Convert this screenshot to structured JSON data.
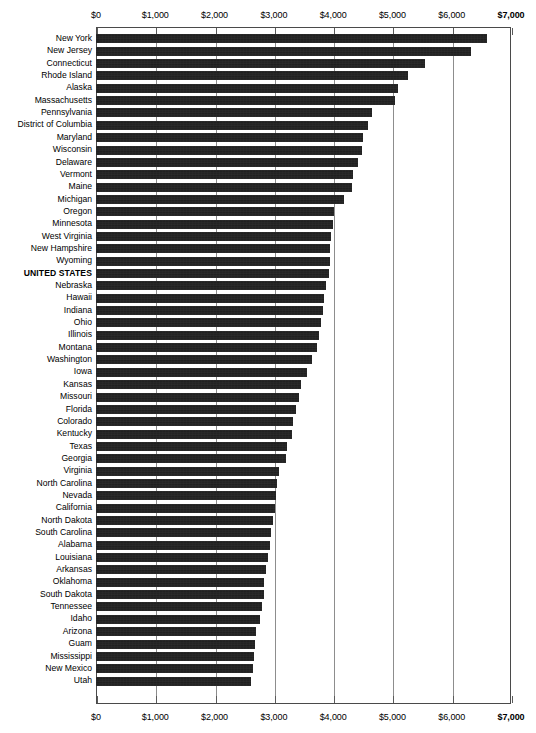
{
  "chart_data": {
    "type": "bar",
    "orientation": "horizontal",
    "title": "",
    "xlabel": "",
    "ylabel": "",
    "xlim": [
      0,
      7000
    ],
    "xticks": [
      0,
      1000,
      2000,
      3000,
      4000,
      5000,
      6000,
      7000
    ],
    "xtick_labels": [
      "$0",
      "$1,000",
      "$2,000",
      "$3,000",
      "$4,000",
      "$5,000",
      "$6,000",
      "$7,000"
    ],
    "grid": true,
    "grid_axis": "x",
    "legend": "none",
    "axis_position": "both-top-and-bottom",
    "bar_color": "#151515",
    "highlight_category": "UNITED STATES",
    "categories": [
      "New York",
      "New Jersey",
      "Connecticut",
      "Rhode Island",
      "Alaska",
      "Massachusetts",
      "Pennsylvania",
      "District of Columbia",
      "Maryland",
      "Wisconsin",
      "Delaware",
      "Vermont",
      "Maine",
      "Michigan",
      "Oregon",
      "Minnesota",
      "West Virginia",
      "New Hampshire",
      "Wyoming",
      "UNITED STATES",
      "Nebraska",
      "Hawaii",
      "Indiana",
      "Ohio",
      "Illinois",
      "Montana",
      "Washington",
      "Iowa",
      "Kansas",
      "Missouri",
      "Florida",
      "Colorado",
      "Kentucky",
      "Texas",
      "Georgia",
      "Virginia",
      "North Carolina",
      "Nevada",
      "California",
      "North Dakota",
      "South Carolina",
      "Alabama",
      "Louisiana",
      "Arkansas",
      "Oklahoma",
      "South Dakota",
      "Tennessee",
      "Idaho",
      "Arizona",
      "Guam",
      "Mississippi",
      "New Mexico",
      "Utah"
    ],
    "values": [
      6590,
      6320,
      5550,
      5260,
      5100,
      5040,
      4660,
      4580,
      4500,
      4480,
      4420,
      4340,
      4320,
      4180,
      4020,
      3990,
      3960,
      3950,
      3940,
      3930,
      3880,
      3850,
      3830,
      3800,
      3760,
      3720,
      3640,
      3560,
      3450,
      3430,
      3370,
      3330,
      3300,
      3230,
      3200,
      3080,
      3060,
      3040,
      3020,
      2980,
      2960,
      2930,
      2900,
      2870,
      2840,
      2830,
      2800,
      2760,
      2700,
      2680,
      2660,
      2650,
      2620
    ]
  }
}
